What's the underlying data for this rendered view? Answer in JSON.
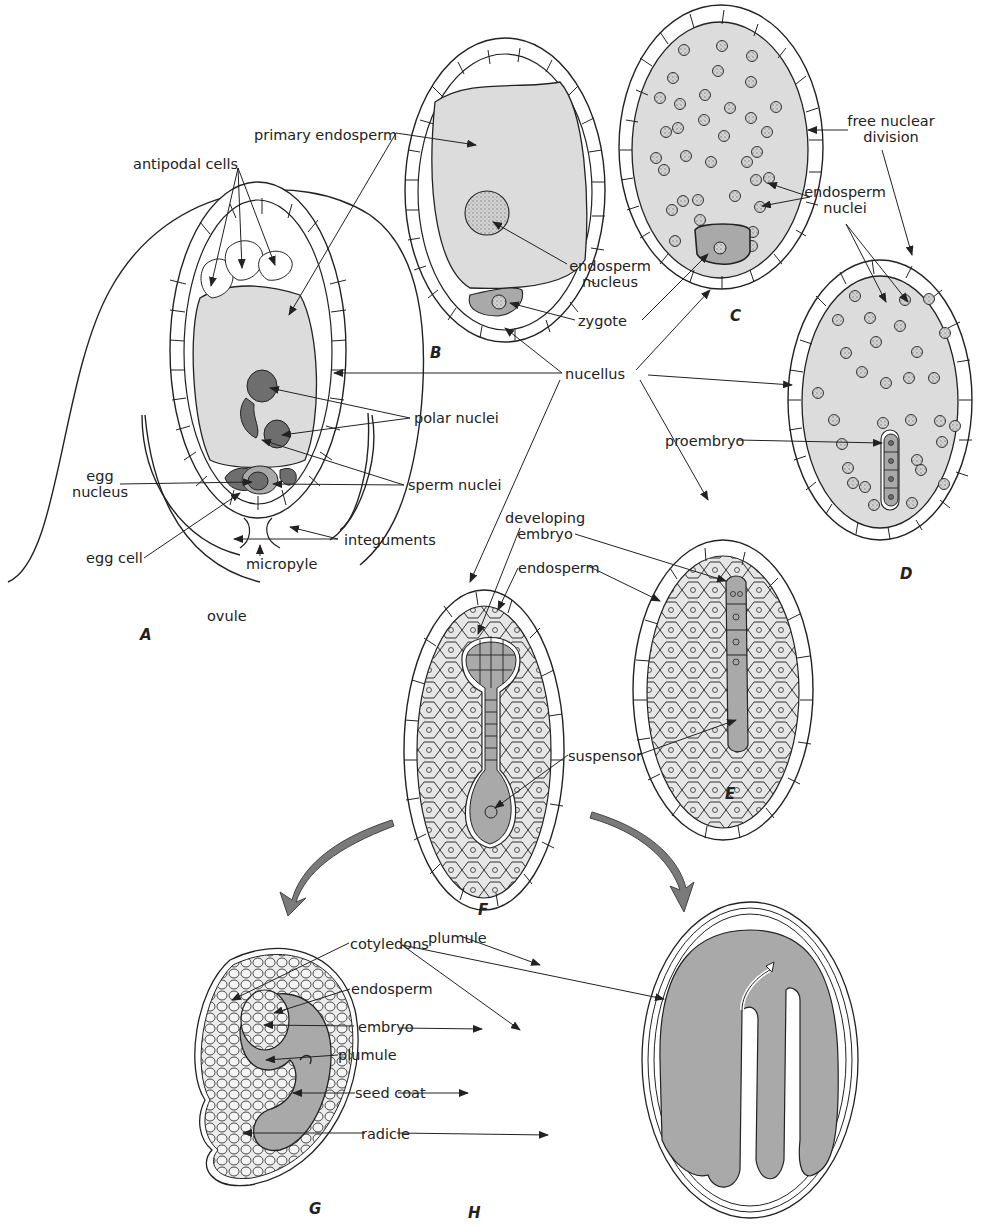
{
  "figure": {
    "type": "biology diagram",
    "colors": {
      "background": "#ffffff",
      "line": "#222222",
      "cytoplasm_fill": "#dcdcdc",
      "endosperm_cell_fill": "#e6e6e6",
      "dark_nucleus_fill": "#6e6e6e",
      "embryo_fill": "#a9a9a9",
      "process_arrow_fill": "#7a7a7a"
    }
  },
  "panels": [
    {
      "letter": "A",
      "caption": "ovule"
    },
    {
      "letter": "B",
      "caption": ""
    },
    {
      "letter": "C",
      "caption": ""
    },
    {
      "letter": "D",
      "caption": ""
    },
    {
      "letter": "E",
      "caption": ""
    },
    {
      "letter": "F",
      "caption": ""
    },
    {
      "letter": "G",
      "caption": ""
    },
    {
      "letter": "H",
      "caption": ""
    }
  ],
  "labels": {
    "antipodal_cells": "antipodal cells",
    "primary_endosperm": "primary endosperm",
    "polar_nuclei": "polar nuclei",
    "sperm_nuclei": "sperm nuclei",
    "egg_nucleus_line1": "egg",
    "egg_nucleus_line2": "nucleus",
    "egg_cell": "egg cell",
    "micropyle": "micropyle",
    "integuments": "integuments",
    "ovule": "ovule",
    "endosperm_nucleus_line1": "endosperm",
    "endosperm_nucleus_line2": "nucleus",
    "zygote": "zygote",
    "nucellus": "nucellus",
    "free_nuclear_division_line1": "free nuclear",
    "free_nuclear_division_line2": "division",
    "endosperm_nuclei_line1": "endosperm",
    "endosperm_nuclei_line2": "nuclei",
    "proembryo": "proembryo",
    "developing_embryo_line1": "developing",
    "developing_embryo_line2": "embryo",
    "endosperm_f": "endosperm",
    "suspensor": "suspensor",
    "cotyledons": "cotyledons",
    "plumule_h": "plumule",
    "endosperm_g": "endosperm",
    "embryo": "embryo",
    "plumule_g": "plumule",
    "seed_coat": "seed coat",
    "radicle": "radicle"
  }
}
